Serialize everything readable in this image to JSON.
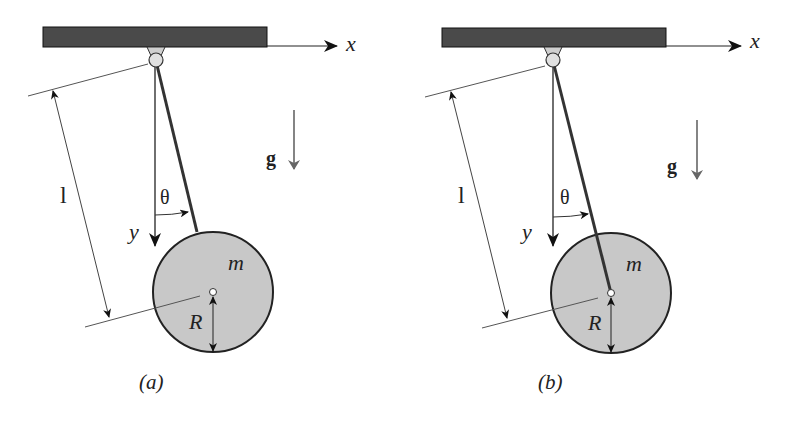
{
  "figure": {
    "panels": [
      {
        "id": "a",
        "caption": "(a)",
        "axis_x_label": "x",
        "axis_y_label": "y",
        "gravity_label": "g",
        "length_label": "l",
        "angle_label": "θ",
        "mass_label": "m",
        "radius_label": "R",
        "rod_attachment": "rim of disk"
      },
      {
        "id": "b",
        "caption": "(b)",
        "axis_x_label": "x",
        "axis_y_label": "y",
        "gravity_label": "g",
        "length_label": "l",
        "angle_label": "θ",
        "mass_label": "m",
        "radius_label": "R",
        "rod_attachment": "center of disk"
      }
    ],
    "colors": {
      "ceiling": "#4a4a4a",
      "disk_fill": "#c8c8c8",
      "pivot_fill": "#d9d9d9",
      "line": "#222222",
      "gravity_arrow": "#666666"
    }
  }
}
